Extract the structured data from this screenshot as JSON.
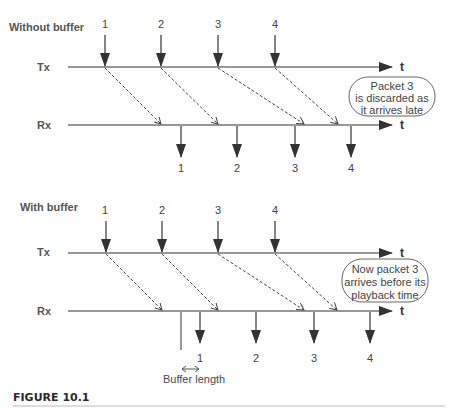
{
  "figure": {
    "caption": "FIGURE 10.1",
    "axis_end_label": "t"
  },
  "top_diagram": {
    "title": "Without buffer",
    "tx_label": "Tx",
    "rx_label": "Rx",
    "tx_packets": [
      "1",
      "2",
      "3",
      "4"
    ],
    "rx_packets": [
      "1",
      "2",
      "3",
      "4"
    ],
    "note_lines": [
      "Packet 3",
      "is discarded as",
      "it arrives late"
    ]
  },
  "bottom_diagram": {
    "title": "With buffer",
    "tx_label": "Tx",
    "rx_label": "Rx",
    "tx_packets": [
      "1",
      "2",
      "3",
      "4"
    ],
    "rx_packets": [
      "1",
      "2",
      "3",
      "4"
    ],
    "note_lines": [
      "Now packet 3",
      "arrives before its",
      "playback time"
    ],
    "buffer_label": "Buffer length"
  },
  "colors": {
    "line": "#333333",
    "dashed": "#444444",
    "bubble_border": "#666666",
    "text": "#444444"
  }
}
